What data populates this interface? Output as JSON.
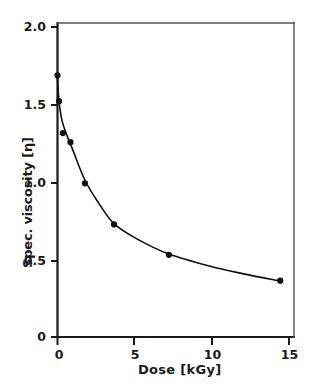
{
  "chart_data": {
    "type": "scatter",
    "title": "",
    "xlabel": "Dose [kGy]",
    "ylabel": "Spec. viscosity [η]",
    "xlim": [
      0,
      15.5
    ],
    "ylim": [
      0,
      2.07
    ],
    "grid": false,
    "legend": null,
    "xticks": [
      "0",
      "5",
      "10",
      "15"
    ],
    "xtick_values": [
      0,
      5,
      10,
      15
    ],
    "yticks": [
      "0",
      "0.5",
      "1.0",
      "1.5",
      "2.0"
    ],
    "ytick_values": [
      0,
      0.5,
      1.0,
      1.5,
      2.0
    ],
    "series": [
      {
        "name": "Spec. viscosity vs dose",
        "marker": "filled-circle",
        "line": "smooth-fit-curve",
        "x": [
          0,
          0.1,
          0.35,
          0.85,
          1.8,
          3.7,
          7.3,
          14.6
        ],
        "y": [
          1.72,
          1.55,
          1.34,
          1.28,
          1.01,
          0.74,
          0.54,
          0.37
        ]
      }
    ],
    "colors": {
      "axis": "#1a1a1a",
      "marker": "#111111",
      "curve": "#111111",
      "background": "#ffffff"
    }
  },
  "axes": {
    "x_axis_label": "Dose [kGy]",
    "y_axis_label": "Spec. viscosity [η]"
  },
  "ticks": {
    "x": [
      {
        "label": "0"
      },
      {
        "label": "5"
      },
      {
        "label": "10"
      },
      {
        "label": "15"
      }
    ],
    "y": [
      {
        "label": "2.0"
      },
      {
        "label": "1.5"
      },
      {
        "label": "1.0"
      },
      {
        "label": "0.5"
      },
      {
        "label": "0"
      }
    ]
  }
}
